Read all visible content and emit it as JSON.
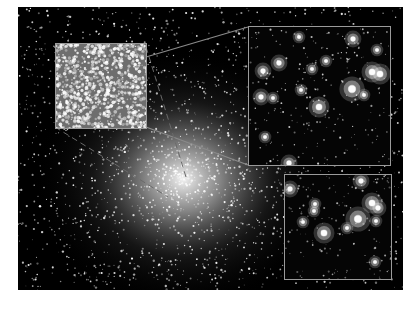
{
  "figure": {
    "background_color": "#000000",
    "page_color": "#ffffff",
    "frame_color": "#9a9a9a",
    "insets": [
      {
        "name": "zoom-inset-left",
        "description": "dense stellar field near cluster core"
      },
      {
        "name": "zoom-inset-top-right",
        "description": "resolved stars, higher magnification"
      },
      {
        "name": "zoom-inset-bottom-right",
        "description": "resolved stars, highest magnification"
      }
    ]
  }
}
